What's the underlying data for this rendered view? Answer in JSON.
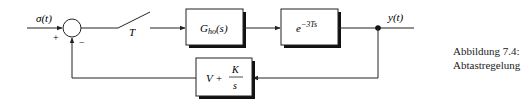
{
  "diagram": {
    "type": "block-diagram",
    "input_label": "σ(t)",
    "output_label": "y(t)",
    "summing_junction": {
      "plus_sign": "+",
      "minus_sign": "−"
    },
    "switch_label": "T",
    "blocks": [
      {
        "id": "hold",
        "label_main": "G",
        "label_sub": "ho",
        "label_suffix": "(s)"
      },
      {
        "id": "delay",
        "label_base": "e",
        "label_exp": "−3Ts"
      },
      {
        "id": "controller",
        "label_left": "V +",
        "frac_num": "K",
        "frac_den": "s"
      }
    ]
  },
  "caption": {
    "line1": "Abbildung 7.4:",
    "line2": "Abtastregelung"
  },
  "colors": {
    "line": "#222222",
    "shadow": "#111111",
    "background": "#ffffff"
  }
}
